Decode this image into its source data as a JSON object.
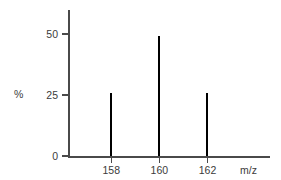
{
  "chart_data": {
    "type": "bar",
    "title": "",
    "subtitle": "",
    "xlabel": "m/z",
    "ylabel": "%",
    "categories": [
      "158",
      "160",
      "162"
    ],
    "values": [
      26,
      49,
      26
    ],
    "series": [
      {
        "name": "relative abundance",
        "values": [
          26,
          49,
          26
        ]
      }
    ],
    "x": [
      158,
      160,
      162
    ],
    "xlim": [
      156.2,
      164.6
    ],
    "ylim": [
      0,
      58
    ],
    "x_tick_labels": [
      "158",
      "160",
      "162"
    ],
    "y_tick_labels": [
      "0",
      "25",
      "50"
    ],
    "y_ticks": [
      0,
      25,
      50
    ],
    "grid": false,
    "legend": false,
    "legend_position": "none",
    "annotations": []
  },
  "axes": {
    "y_title": "%",
    "x_title": "m/z"
  },
  "colors": {
    "background": "#ffffff",
    "axis": "#4a4a4a",
    "peak": "#000000",
    "text": "#3b3b3b"
  }
}
